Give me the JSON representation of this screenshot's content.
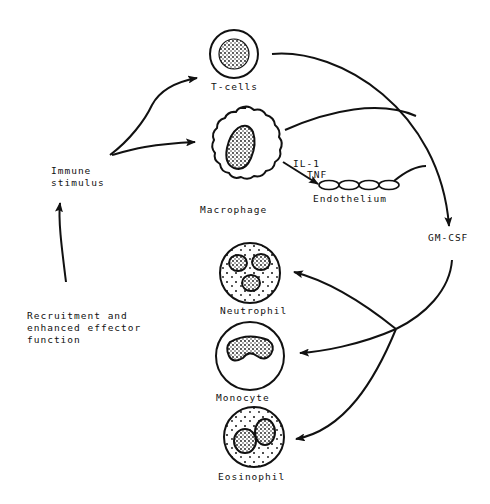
{
  "diagram": {
    "type": "cell-signaling-cycle",
    "nodes": {
      "immune_stimulus": {
        "label_line1": "Immune",
        "label_line2": "stimulus"
      },
      "t_cells": {
        "label": "T-cells"
      },
      "macrophage": {
        "label": "Macrophage"
      },
      "endothelium": {
        "label": "Endothelium"
      },
      "gm_csf": {
        "label": "GM-CSF"
      },
      "neutrophil": {
        "label": "Neutrophil"
      },
      "monocyte": {
        "label": "Monocyte"
      },
      "eosinophil": {
        "label": "Eosinophil"
      },
      "recruitment": {
        "label_line1": "Recruitment and",
        "label_line2": "enhanced effector",
        "label_line3": "function"
      }
    },
    "edge_labels": {
      "il1": "IL-1",
      "tnf": "TNF"
    },
    "edges": [
      {
        "from": "Immune stimulus",
        "to": "T-cells"
      },
      {
        "from": "Immune stimulus",
        "to": "Macrophage"
      },
      {
        "from": "Macrophage",
        "to": "Endothelium",
        "label": "IL-1 / TNF"
      },
      {
        "from": "T-cells",
        "to": "GM-CSF"
      },
      {
        "from": "Macrophage",
        "to": "GM-CSF"
      },
      {
        "from": "Endothelium",
        "to": "GM-CSF"
      },
      {
        "from": "GM-CSF",
        "to": "Neutrophil"
      },
      {
        "from": "GM-CSF",
        "to": "Monocyte"
      },
      {
        "from": "GM-CSF",
        "to": "Eosinophil"
      },
      {
        "from": "Recruitment and enhanced effector function",
        "to": "Immune stimulus"
      }
    ]
  }
}
